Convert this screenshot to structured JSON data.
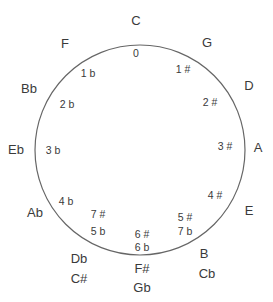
{
  "diagram": {
    "circle": {
      "cx": 140,
      "cy": 150,
      "r": 105,
      "stroke": "#666666"
    },
    "keys": [
      {
        "id": "c",
        "label": "C",
        "x": 136,
        "y": 20
      },
      {
        "id": "g",
        "label": "G",
        "x": 207,
        "y": 42
      },
      {
        "id": "d",
        "label": "D",
        "x": 249,
        "y": 85
      },
      {
        "id": "a",
        "label": "A",
        "x": 258,
        "y": 147
      },
      {
        "id": "e",
        "label": "E",
        "x": 249,
        "y": 210
      },
      {
        "id": "b",
        "label": "B",
        "x": 204,
        "y": 253
      },
      {
        "id": "cb",
        "label": "Cb",
        "x": 207,
        "y": 273
      },
      {
        "id": "fsharp",
        "label": "F#",
        "x": 142,
        "y": 268
      },
      {
        "id": "gb",
        "label": "Gb",
        "x": 142,
        "y": 287
      },
      {
        "id": "db",
        "label": "Db",
        "x": 79,
        "y": 258
      },
      {
        "id": "csharp",
        "label": "C#",
        "x": 79,
        "y": 278
      },
      {
        "id": "ab",
        "label": "Ab",
        "x": 35,
        "y": 212
      },
      {
        "id": "eb",
        "label": "Eb",
        "x": 16,
        "y": 149
      },
      {
        "id": "bb",
        "label": "Bb",
        "x": 29,
        "y": 88
      },
      {
        "id": "f",
        "label": "F",
        "x": 65,
        "y": 43
      }
    ],
    "signatures": [
      {
        "id": "sig-0",
        "label": "0",
        "x": 136,
        "y": 53
      },
      {
        "id": "sig-1sharp",
        "label": "1 #",
        "x": 183,
        "y": 69
      },
      {
        "id": "sig-2sharp",
        "label": "2 #",
        "x": 210,
        "y": 102
      },
      {
        "id": "sig-3sharp",
        "label": "3 #",
        "x": 225,
        "y": 146
      },
      {
        "id": "sig-4sharp",
        "label": "4 #",
        "x": 215,
        "y": 195
      },
      {
        "id": "sig-5sharp",
        "label": "5 #",
        "x": 185,
        "y": 217
      },
      {
        "id": "sig-7flat",
        "label": "7 b",
        "x": 185,
        "y": 231
      },
      {
        "id": "sig-6sharp",
        "label": "6 #",
        "x": 142,
        "y": 234
      },
      {
        "id": "sig-6flat",
        "label": "6 b",
        "x": 142,
        "y": 247
      },
      {
        "id": "sig-7sharp",
        "label": "7 #",
        "x": 98,
        "y": 214
      },
      {
        "id": "sig-5flat",
        "label": "5 b",
        "x": 98,
        "y": 231
      },
      {
        "id": "sig-4flat",
        "label": "4 b",
        "x": 66,
        "y": 201
      },
      {
        "id": "sig-3flat",
        "label": "3 b",
        "x": 53,
        "y": 150
      },
      {
        "id": "sig-2flat",
        "label": "2 b",
        "x": 67,
        "y": 104
      },
      {
        "id": "sig-1flat",
        "label": "1 b",
        "x": 88,
        "y": 73
      }
    ]
  }
}
